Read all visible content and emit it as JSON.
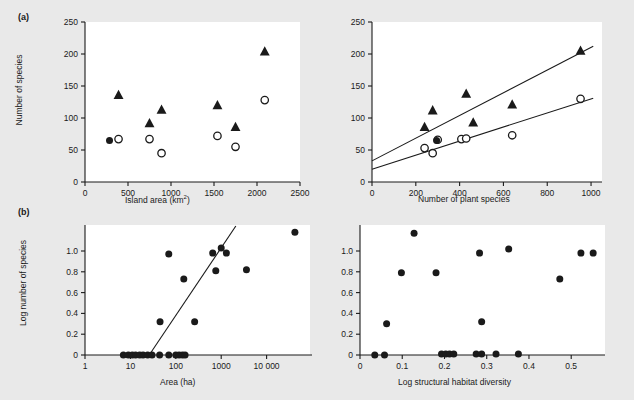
{
  "figure": {
    "background": "#e9e9e9",
    "plot_background": "#ffffff",
    "ink": "#1a1a1a",
    "panels": [
      {
        "tag": "(a)"
      },
      {
        "tag": "(b)"
      }
    ]
  },
  "chart_data": [
    {
      "id": "a-left",
      "type": "scatter",
      "title": "",
      "xlabel": "Island area (km2)",
      "xlabel_display": "Island area (km²)",
      "ylabel": "Number of species",
      "xlim": [
        0,
        2500
      ],
      "ylim": [
        0,
        250
      ],
      "xticks": [
        0,
        500,
        1000,
        1500,
        2000,
        2500
      ],
      "xticklabels": [
        "0",
        "500",
        "1000",
        "1500",
        "2000",
        "2500"
      ],
      "yticks": [
        0,
        50,
        100,
        150,
        200,
        250
      ],
      "yticklabels": [
        "0",
        "50",
        "100",
        "150",
        "200",
        "250"
      ],
      "grid": false,
      "legend": "none",
      "series": [
        {
          "name": "filled-triangle",
          "marker": "triangle",
          "fill": "#1a1a1a",
          "points": [
            [
              390,
              136
            ],
            [
              750,
              92
            ],
            [
              890,
              113
            ],
            [
              1540,
              120
            ],
            [
              1750,
              86
            ],
            [
              2090,
              204
            ]
          ]
        },
        {
          "name": "open-circle",
          "marker": "circle-open",
          "fill": "none",
          "points": [
            [
              390,
              67
            ],
            [
              750,
              67
            ],
            [
              890,
              45
            ],
            [
              1540,
              72
            ],
            [
              1750,
              55
            ],
            [
              2090,
              128
            ]
          ]
        },
        {
          "name": "filled-circle",
          "marker": "circle-filled",
          "fill": "#1a1a1a",
          "points": [
            [
              285,
              65
            ]
          ]
        }
      ]
    },
    {
      "id": "a-right",
      "type": "scatter",
      "title": "",
      "xlabel": "Number of plant species",
      "ylabel": "",
      "xlim": [
        0,
        1050
      ],
      "ylim": [
        0,
        250
      ],
      "xticks": [
        0,
        200,
        400,
        600,
        800,
        1000
      ],
      "xticklabels": [
        "0",
        "200",
        "400",
        "600",
        "800",
        "1000"
      ],
      "yticks": [
        0,
        50,
        100,
        150,
        200,
        250
      ],
      "yticklabels": [
        "0",
        "50",
        "100",
        "150",
        "200",
        "250"
      ],
      "grid": false,
      "legend": "none",
      "series": [
        {
          "name": "filled-triangle",
          "marker": "triangle",
          "fill": "#1a1a1a",
          "points": [
            [
              240,
              86
            ],
            [
              277,
              112
            ],
            [
              430,
              138
            ],
            [
              462,
              93
            ],
            [
              640,
              121
            ],
            [
              952,
              205
            ]
          ]
        },
        {
          "name": "open-circle",
          "marker": "circle-open",
          "fill": "none",
          "points": [
            [
              240,
              53
            ],
            [
              277,
              45
            ],
            [
              300,
              66
            ],
            [
              408,
              67
            ],
            [
              430,
              68
            ],
            [
              640,
              73
            ],
            [
              952,
              130
            ]
          ]
        },
        {
          "name": "filled-circle",
          "marker": "circle-filled",
          "fill": "#1a1a1a",
          "points": [
            [
              295,
              65
            ]
          ]
        }
      ],
      "fit_lines": [
        {
          "name": "triangle-fit",
          "x1": 0,
          "y1": 33,
          "x2": 1010,
          "y2": 212
        },
        {
          "name": "circle-fit",
          "x1": 0,
          "y1": 20,
          "x2": 1010,
          "y2": 131
        }
      ]
    },
    {
      "id": "b-left",
      "type": "scatter",
      "title": "",
      "xlabel": "Area (ha)",
      "ylabel": "Log number of species",
      "xscale": "log",
      "xlim": [
        1,
        100000
      ],
      "ylim": [
        0,
        1.25
      ],
      "xticks": [
        1,
        10,
        100,
        1000,
        10000
      ],
      "xticklabels": [
        "1",
        "10",
        "100",
        "1000",
        "10 000"
      ],
      "yticks": [
        0,
        0.2,
        0.4,
        0.6,
        0.8,
        1.0
      ],
      "yticklabels": [
        "0",
        "0.2",
        "0.4",
        "0.6",
        "0.8",
        "1.0"
      ],
      "grid": false,
      "legend": "none",
      "series": [
        {
          "name": "filled-circle",
          "marker": "circle-filled",
          "fill": "#1a1a1a",
          "points": [
            [
              7,
              0
            ],
            [
              9,
              0
            ],
            [
              11,
              0
            ],
            [
              13,
              0
            ],
            [
              16,
              0
            ],
            [
              19,
              0
            ],
            [
              24,
              0
            ],
            [
              30,
              0
            ],
            [
              44,
              0
            ],
            [
              70,
              0
            ],
            [
              100,
              0
            ],
            [
              118,
              0
            ],
            [
              140,
              0
            ],
            [
              160,
              0
            ],
            [
              45,
              0.32
            ],
            [
              70,
              0.97
            ],
            [
              150,
              0.73
            ],
            [
              260,
              0.32
            ],
            [
              650,
              0.98
            ],
            [
              760,
              0.81
            ],
            [
              1000,
              1.03
            ],
            [
              1300,
              0.98
            ],
            [
              3600,
              0.82
            ],
            [
              42000,
              1.18
            ]
          ]
        }
      ],
      "fit_lines": [
        {
          "name": "regression",
          "x1": 26,
          "y1": 0,
          "x2": 2100,
          "y2": 1.24
        }
      ]
    },
    {
      "id": "b-right",
      "type": "scatter",
      "title": "",
      "xlabel": "Log structural habitat diversity",
      "ylabel": "",
      "xlim": [
        0,
        0.58
      ],
      "ylim": [
        0,
        1.25
      ],
      "xticks": [
        0,
        0.1,
        0.2,
        0.3,
        0.4,
        0.5
      ],
      "xticklabels": [
        "0",
        "0.1",
        "0.2",
        "0.3",
        "0.4",
        "0.5"
      ],
      "yticks": [
        0,
        0.2,
        0.4,
        0.6,
        0.8,
        1.0
      ],
      "yticklabels": [
        "0",
        "0.2",
        "0.4",
        "0.6",
        "0.8",
        "1.0"
      ],
      "grid": false,
      "legend": "none",
      "series": [
        {
          "name": "filled-circle",
          "marker": "circle-filled",
          "fill": "#1a1a1a",
          "points": [
            [
              0.035,
              0
            ],
            [
              0.058,
              0
            ],
            [
              0.193,
              0.01
            ],
            [
              0.203,
              0.01
            ],
            [
              0.212,
              0.01
            ],
            [
              0.222,
              0.01
            ],
            [
              0.275,
              0.01
            ],
            [
              0.288,
              0.01
            ],
            [
              0.322,
              0.01
            ],
            [
              0.375,
              0.01
            ],
            [
              0.063,
              0.3
            ],
            [
              0.288,
              0.32
            ],
            [
              0.098,
              0.79
            ],
            [
              0.18,
              0.79
            ],
            [
              0.473,
              0.73
            ],
            [
              0.128,
              1.17
            ],
            [
              0.283,
              0.98
            ],
            [
              0.352,
              1.02
            ],
            [
              0.523,
              0.98
            ],
            [
              0.552,
              0.98
            ]
          ]
        }
      ]
    }
  ]
}
